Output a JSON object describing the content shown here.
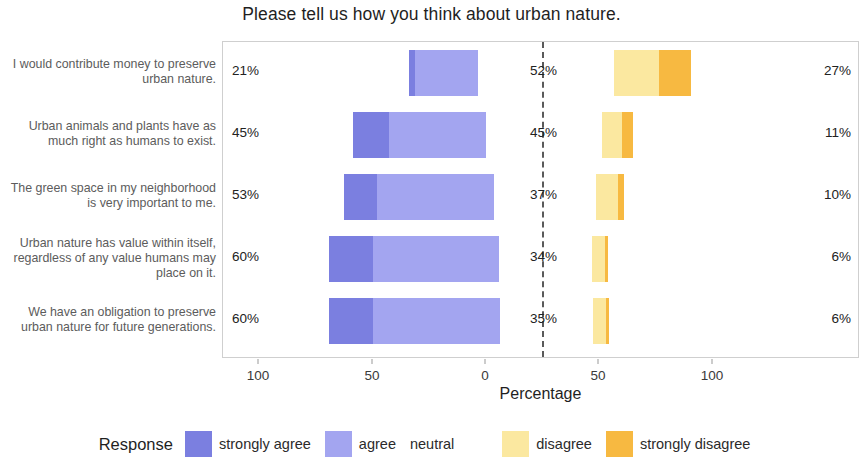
{
  "chart_data": {
    "type": "bar",
    "subtype": "diverging-stacked-likert",
    "title": "Please tell us how you think about urban nature.",
    "xlabel": "Percentage",
    "ylabel": "",
    "xlim": [
      -110,
      110
    ],
    "xticks": [
      -100,
      -50,
      0,
      50,
      100
    ],
    "xticklabels": [
      "100",
      "50",
      "0",
      "50",
      "100"
    ],
    "grid": false,
    "legend_position": "bottom",
    "legend_title": "Response",
    "series": [
      {
        "name": "strongly agree",
        "color": "#7b7fe0",
        "values": [
          3,
          12,
          19,
          24,
          24
        ]
      },
      {
        "name": "agree",
        "color": "#a3a5f0",
        "values": [
          18,
          33,
          34,
          36,
          36
        ]
      },
      {
        "name": "neutral",
        "color": "#ffffff",
        "values": [
          52,
          45,
          37,
          34,
          35
        ]
      },
      {
        "name": "disagree",
        "color": "#fbe8a0",
        "values": [
          19,
          8,
          8,
          5,
          5
        ]
      },
      {
        "name": "strongly disagree",
        "color": "#f7b941",
        "values": [
          8,
          3,
          2,
          1,
          1
        ]
      }
    ],
    "categories": [
      "I would contribute money to preserve urban nature.",
      "Urban animals and plants have as much right as humans to exist.",
      "The green space in my neighborhood is very important to me.",
      "Urban nature has value within itself, regardless of any value humans may place on it.",
      "We have an obligation to preserve urban nature for future generations."
    ],
    "annotations": {
      "agree_totals": [
        "21%",
        "45%",
        "53%",
        "60%",
        "60%"
      ],
      "neutral_totals": [
        "52%",
        "45%",
        "37%",
        "34%",
        "35%"
      ],
      "disagree_totals": [
        "27%",
        "11%",
        "10%",
        "6%",
        "6%"
      ]
    }
  },
  "rows": [
    {
      "label": "I would contribute money to preserve urban nature.",
      "left_pct": "21%",
      "mid_pct": "52%",
      "right_pct": "27%",
      "strongly_agree_left": 408,
      "strongly_agree_right": 414,
      "agree_left": 414,
      "agree_right": 477,
      "disagree_left": 613,
      "disagree_right": 658,
      "strongly_disagree_left": 658,
      "strongly_disagree_right": 690,
      "top": 8,
      "height": 46
    },
    {
      "label": "Urban animals and plants have as much right as humans to exist.",
      "left_pct": "45%",
      "mid_pct": "45%",
      "right_pct": "11%",
      "strongly_agree_left": 352,
      "strongly_agree_right": 388,
      "agree_left": 388,
      "agree_right": 485,
      "disagree_left": 601,
      "disagree_right": 621,
      "strongly_disagree_left": 621,
      "strongly_disagree_right": 632,
      "top": 70,
      "height": 46
    },
    {
      "label": "The green space in my neighborhood is very important to me.",
      "left_pct": "53%",
      "mid_pct": "37%",
      "right_pct": "10%",
      "strongly_agree_left": 343,
      "strongly_agree_right": 376,
      "agree_left": 376,
      "agree_right": 493,
      "disagree_left": 595,
      "disagree_right": 617,
      "strongly_disagree_left": 617,
      "strongly_disagree_right": 623,
      "top": 132,
      "height": 46
    },
    {
      "label": "Urban nature has value within itself, regardless of any value humans may place on it.",
      "left_pct": "60%",
      "mid_pct": "34%",
      "right_pct": "6%",
      "strongly_agree_left": 328,
      "strongly_agree_right": 372,
      "agree_left": 372,
      "agree_right": 498,
      "disagree_left": 591,
      "disagree_right": 604,
      "strongly_disagree_left": 604,
      "strongly_disagree_right": 607,
      "top": 194,
      "height": 46
    },
    {
      "label": "We have an obligation to preserve urban nature for future generations.",
      "left_pct": "60%",
      "mid_pct": "35%",
      "right_pct": "6%",
      "strongly_agree_left": 328,
      "strongly_agree_right": 372,
      "agree_left": 372,
      "agree_right": 499,
      "disagree_left": 592,
      "disagree_right": 605,
      "strongly_disagree_left": 605,
      "strongly_disagree_right": 608,
      "top": 256,
      "height": 46
    }
  ],
  "axis": {
    "ticks": [
      {
        "label": "100",
        "x": 258
      },
      {
        "label": "50",
        "x": 372
      },
      {
        "label": "0",
        "x": 485
      },
      {
        "label": "50",
        "x": 598
      },
      {
        "label": "100",
        "x": 712
      }
    ],
    "title": "Percentage"
  },
  "zero_line_x": 541,
  "legend": {
    "title": "Response",
    "items": [
      {
        "label": "strongly agree",
        "color": "#7b7fe0",
        "swatch": true
      },
      {
        "label": "agree",
        "color": "#a3a5f0",
        "swatch": true
      },
      {
        "label": "neutral",
        "color": "#ffffff",
        "swatch": false
      },
      {
        "label": "disagree",
        "color": "#fbe8a0",
        "swatch": true
      },
      {
        "label": "strongly disagree",
        "color": "#f7b941",
        "swatch": true
      }
    ]
  },
  "colors": {
    "strongly_agree": "#7b7fe0",
    "agree": "#a3a5f0",
    "neutral": "#ffffff",
    "disagree": "#fbe8a0",
    "strongly_disagree": "#f7b941",
    "panel_border": "#cfcfcf",
    "text": "#2b2b2b",
    "label_text": "#5c5c5c"
  }
}
